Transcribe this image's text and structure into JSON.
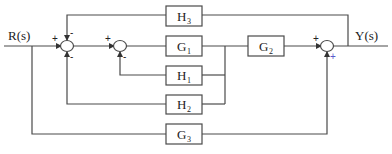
{
  "diagram": {
    "type": "control-system-block-diagram",
    "input_label": "R(s)",
    "output_label": "Y(s)",
    "blocks": [
      {
        "id": "H3",
        "letter": "H",
        "sub": "3",
        "role": "outer feedback from Y(s) to first summing junction"
      },
      {
        "id": "G1",
        "letter": "G",
        "sub": "1",
        "role": "forward path"
      },
      {
        "id": "G2",
        "letter": "G",
        "sub": "2",
        "role": "forward path"
      },
      {
        "id": "H1",
        "letter": "H",
        "sub": "1",
        "role": "feedback from G1 output to second summing junction"
      },
      {
        "id": "H2",
        "letter": "H",
        "sub": "2",
        "role": "feedback from G1 output to first summing junction"
      },
      {
        "id": "G3",
        "letter": "G",
        "sub": "3",
        "role": "feedforward from R(s) to output summing junction"
      }
    ],
    "summing_junctions": [
      {
        "id": "S1",
        "signs": {
          "left": "+",
          "top": "-",
          "bottom": "-"
        }
      },
      {
        "id": "S2",
        "signs": {
          "left": "+",
          "bottom": "-"
        }
      },
      {
        "id": "S3",
        "signs": {
          "left": "+",
          "bottom": "+"
        }
      }
    ],
    "colors": {
      "line": "#4a4a4a",
      "text": "#222222",
      "plus_accent": "#5a5acc"
    }
  }
}
